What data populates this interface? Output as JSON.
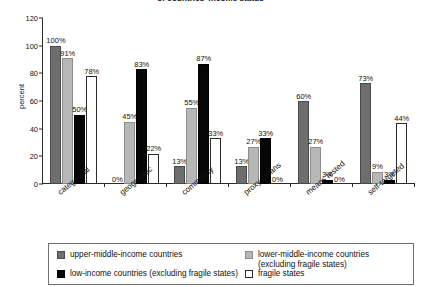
{
  "chart_data": {
    "type": "bar",
    "title": "of countries' income status",
    "xlabel": "",
    "ylabel": "percent",
    "ylim": [
      0,
      120
    ],
    "yticks": [
      0,
      20,
      40,
      60,
      80,
      100,
      120
    ],
    "grid": false,
    "legend_position": "bottom",
    "categories": [
      "categorical",
      "geographic",
      "community",
      "proxy means",
      "means tested",
      "self-targeted"
    ],
    "series": [
      {
        "name": "upper-middle-income countries",
        "color": "#6e6e6e",
        "values": [
          100,
          0,
          13,
          13,
          60,
          73
        ],
        "labels": [
          "100%",
          "0%",
          "13%",
          "13%",
          "60%",
          "73%"
        ]
      },
      {
        "name": "lower-middle-income countries (excluding fragile states)",
        "color": "#b7b7b7",
        "values": [
          91,
          45,
          55,
          27,
          27,
          9
        ],
        "labels": [
          "91%",
          "45%",
          "55%",
          "27%",
          "27%",
          "9%"
        ]
      },
      {
        "name": "low-income countries (excluding fragile states)",
        "color": "#060606",
        "values": [
          50,
          83,
          87,
          33,
          3,
          3
        ],
        "labels": [
          "50%",
          "83%",
          "87%",
          "33%",
          "3%",
          "3%"
        ]
      },
      {
        "name": "fragile states",
        "color": "#ffffff",
        "values": [
          78,
          22,
          33,
          0,
          0,
          44
        ],
        "labels": [
          "78%",
          "22%",
          "33%",
          "0%",
          "0%",
          "44%"
        ]
      }
    ]
  },
  "legend": {
    "items": [
      {
        "label": "upper-middle-income countries",
        "swatch": "c0"
      },
      {
        "label": "lower-middle-income countries\n(excluding fragile states)",
        "swatch": "c1"
      },
      {
        "label": "low-income countries (excluding fragile states)",
        "swatch": "c2"
      },
      {
        "label": "fragile states",
        "swatch": "c3"
      }
    ]
  }
}
